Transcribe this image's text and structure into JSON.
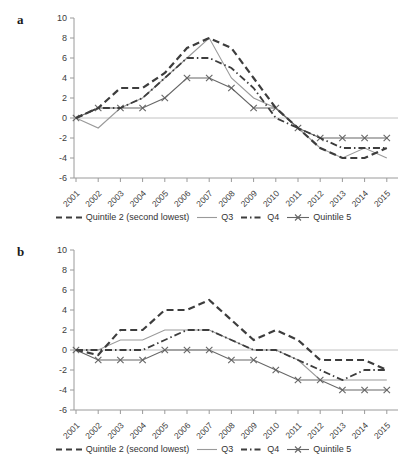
{
  "panels": [
    {
      "label": "a"
    },
    {
      "label": "b"
    }
  ],
  "colors": {
    "line_dark": "#3d3d3d",
    "line_q3": "#9a9a9a",
    "line_q5": "#666666",
    "zero_line": "#c2c2c2",
    "axis": "#9a9a9a",
    "tick_text": "#3c3c3c"
  },
  "chart_data": [
    {
      "type": "line",
      "panel": "a",
      "x": [
        2001,
        2002,
        2003,
        2004,
        2005,
        2006,
        2007,
        2008,
        2009,
        2010,
        2011,
        2012,
        2013,
        2014,
        2015
      ],
      "ylim": [
        -6,
        10
      ],
      "yticks": [
        10,
        8,
        6,
        4,
        2,
        0,
        -2,
        -4,
        -6
      ],
      "grid": "zero-line-only",
      "legend_position": "bottom",
      "series": [
        {
          "name": "Quintile 2 (second lowest)",
          "line": "thick-dashed",
          "values": [
            0,
            1,
            3,
            3,
            4.5,
            7,
            8,
            7,
            4,
            1,
            -1,
            -3,
            -4,
            -4,
            -3
          ]
        },
        {
          "name": "Q3",
          "line": "thin-solid",
          "values": [
            0,
            -1,
            1,
            2,
            4,
            6,
            8,
            4,
            2,
            1,
            -1,
            -3,
            -4,
            -3,
            -4
          ]
        },
        {
          "name": "Q4",
          "line": "dash-dot",
          "values": [
            0,
            1,
            1,
            2,
            4,
            6,
            6,
            5,
            3,
            0,
            -1,
            -2,
            -3,
            -3,
            -3
          ]
        },
        {
          "name": "Quintile 5",
          "line": "solid-x-markers",
          "values": [
            0,
            1,
            1,
            1,
            2,
            4,
            4,
            3,
            1,
            1,
            -1,
            -2,
            -2,
            -2,
            -2
          ]
        }
      ]
    },
    {
      "type": "line",
      "panel": "b",
      "x": [
        2001,
        2002,
        2003,
        2004,
        2005,
        2006,
        2007,
        2008,
        2009,
        2010,
        2011,
        2012,
        2013,
        2014,
        2015
      ],
      "ylim": [
        -6,
        10
      ],
      "yticks": [
        10,
        8,
        6,
        4,
        2,
        0,
        -2,
        -4,
        -6
      ],
      "grid": "zero-line-only",
      "legend_position": "bottom",
      "series": [
        {
          "name": "Quintile 2 (second lowest)",
          "line": "thick-dashed",
          "values": [
            0,
            -0.5,
            2,
            2,
            4,
            4,
            5,
            3,
            1,
            2,
            1,
            -1,
            -1,
            -1,
            -2
          ]
        },
        {
          "name": "Q3",
          "line": "thin-solid",
          "values": [
            0,
            0,
            1,
            1,
            2,
            2,
            2,
            1,
            0,
            0,
            -1,
            -3,
            -3,
            -3,
            -3
          ]
        },
        {
          "name": "Q4",
          "line": "dash-dot",
          "values": [
            0,
            0,
            0,
            0,
            1,
            2,
            2,
            1,
            0,
            0,
            -1,
            -2,
            -3,
            -2,
            -2
          ]
        },
        {
          "name": "Quintile 5",
          "line": "solid-x-markers",
          "values": [
            0,
            -1,
            -1,
            -1,
            0,
            0,
            0,
            -1,
            -1,
            -2,
            -3,
            -3,
            -4,
            -4,
            -4
          ]
        }
      ]
    }
  ]
}
